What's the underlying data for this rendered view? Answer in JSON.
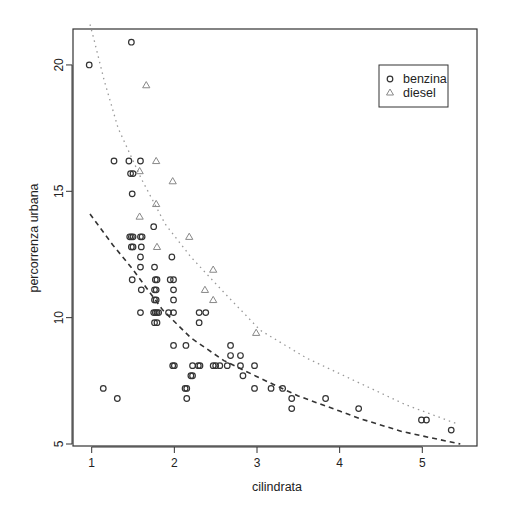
{
  "chart_data": {
    "type": "scatter",
    "title": "",
    "xlabel": "cilindrata",
    "ylabel": "percorrenza urbana",
    "xlim": [
      0.75,
      5.65
    ],
    "ylim": [
      4.95,
      21.7
    ],
    "x_ticks": [
      1,
      2,
      3,
      4,
      5
    ],
    "y_ticks": [
      5,
      10,
      15,
      20
    ],
    "grid": false,
    "legend_position": "top-right",
    "series": [
      {
        "name": "benzina",
        "marker": "circle",
        "color": "#333333",
        "points": [
          [
            0.97,
            20.0
          ],
          [
            1.48,
            20.9
          ],
          [
            1.27,
            16.2
          ],
          [
            1.45,
            16.2
          ],
          [
            1.59,
            16.2
          ],
          [
            1.47,
            15.7
          ],
          [
            1.5,
            15.7
          ],
          [
            1.49,
            14.9
          ],
          [
            1.75,
            13.6
          ],
          [
            1.46,
            13.2
          ],
          [
            1.48,
            13.2
          ],
          [
            1.5,
            13.2
          ],
          [
            1.59,
            13.2
          ],
          [
            1.61,
            13.2
          ],
          [
            1.48,
            12.8
          ],
          [
            1.5,
            12.8
          ],
          [
            1.6,
            12.8
          ],
          [
            1.59,
            12.4
          ],
          [
            1.97,
            12.4
          ],
          [
            1.59,
            12.0
          ],
          [
            1.76,
            12.0
          ],
          [
            1.49,
            11.5
          ],
          [
            1.77,
            11.5
          ],
          [
            1.79,
            11.5
          ],
          [
            1.95,
            11.5
          ],
          [
            1.99,
            11.5
          ],
          [
            1.6,
            11.1
          ],
          [
            1.76,
            11.1
          ],
          [
            1.78,
            11.1
          ],
          [
            1.99,
            11.1
          ],
          [
            1.76,
            10.7
          ],
          [
            1.78,
            10.7
          ],
          [
            1.99,
            10.7
          ],
          [
            1.59,
            10.2
          ],
          [
            1.75,
            10.2
          ],
          [
            1.77,
            10.2
          ],
          [
            1.79,
            10.2
          ],
          [
            1.81,
            10.2
          ],
          [
            1.93,
            10.2
          ],
          [
            1.99,
            10.2
          ],
          [
            2.3,
            10.2
          ],
          [
            2.38,
            10.2
          ],
          [
            1.76,
            9.8
          ],
          [
            1.79,
            9.8
          ],
          [
            2.3,
            9.8
          ],
          [
            1.99,
            8.9
          ],
          [
            2.14,
            8.9
          ],
          [
            2.68,
            8.9
          ],
          [
            2.68,
            8.5
          ],
          [
            2.8,
            8.5
          ],
          [
            1.98,
            8.1
          ],
          [
            2.0,
            8.1
          ],
          [
            2.22,
            8.1
          ],
          [
            2.29,
            8.1
          ],
          [
            2.31,
            8.1
          ],
          [
            2.47,
            8.1
          ],
          [
            2.5,
            8.1
          ],
          [
            2.55,
            8.1
          ],
          [
            2.64,
            8.1
          ],
          [
            2.8,
            8.1
          ],
          [
            2.97,
            8.1
          ],
          [
            2.2,
            7.7
          ],
          [
            2.22,
            7.7
          ],
          [
            2.83,
            7.7
          ],
          [
            1.14,
            7.2
          ],
          [
            2.13,
            7.2
          ],
          [
            2.15,
            7.2
          ],
          [
            2.97,
            7.2
          ],
          [
            3.17,
            7.2
          ],
          [
            3.31,
            7.2
          ],
          [
            1.31,
            6.8
          ],
          [
            2.15,
            6.8
          ],
          [
            3.42,
            6.8
          ],
          [
            3.83,
            6.8
          ],
          [
            3.42,
            6.4
          ],
          [
            4.23,
            6.4
          ],
          [
            4.99,
            5.95
          ],
          [
            5.05,
            5.95
          ],
          [
            5.35,
            5.55
          ]
        ]
      },
      {
        "name": "diesel",
        "marker": "triangle",
        "color": "#888888",
        "points": [
          [
            1.66,
            19.2
          ],
          [
            1.78,
            16.2
          ],
          [
            1.58,
            15.8
          ],
          [
            1.98,
            15.4
          ],
          [
            1.78,
            14.5
          ],
          [
            1.58,
            14.0
          ],
          [
            2.18,
            13.2
          ],
          [
            1.79,
            12.8
          ],
          [
            2.47,
            11.9
          ],
          [
            2.37,
            11.1
          ],
          [
            2.47,
            10.7
          ],
          [
            2.99,
            9.4
          ]
        ]
      }
    ],
    "fit_curves": [
      {
        "name": "benzina fit",
        "style": "dashed",
        "color": "#333333",
        "points": [
          [
            0.98,
            14.1
          ],
          [
            1.25,
            12.9
          ],
          [
            1.5,
            11.9
          ],
          [
            1.86,
            10.3
          ],
          [
            2.2,
            9.2
          ],
          [
            2.6,
            8.3
          ],
          [
            3.04,
            7.6
          ],
          [
            3.5,
            6.9
          ],
          [
            4.0,
            6.3
          ],
          [
            4.25,
            6.0
          ],
          [
            4.75,
            5.5
          ],
          [
            5.1,
            5.25
          ],
          [
            5.46,
            5.0
          ]
        ]
      },
      {
        "name": "diesel fit",
        "style": "dotted",
        "color": "#999999",
        "points": [
          [
            0.98,
            21.6
          ],
          [
            1.02,
            21.1
          ],
          [
            1.15,
            19.4
          ],
          [
            1.32,
            17.5
          ],
          [
            1.6,
            15.5
          ],
          [
            1.89,
            13.7
          ],
          [
            2.2,
            12.4
          ],
          [
            2.6,
            11.0
          ],
          [
            3.04,
            9.5
          ],
          [
            3.6,
            8.4
          ],
          [
            4.25,
            7.4
          ],
          [
            4.8,
            6.55
          ],
          [
            5.42,
            5.8
          ]
        ]
      }
    ]
  },
  "legend": {
    "items": [
      {
        "label": "benzina",
        "symbol": "circle"
      },
      {
        "label": "diesel",
        "symbol": "triangle"
      }
    ]
  },
  "axes": {
    "x_label": "cilindrata",
    "y_label": "percorrenza urbana",
    "x_tick_labels": [
      "1",
      "2",
      "3",
      "4",
      "5"
    ],
    "y_tick_labels": [
      "5",
      "10",
      "15",
      "20"
    ]
  }
}
